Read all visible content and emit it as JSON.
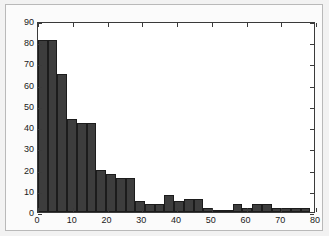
{
  "figure": {
    "background_color": "#fbfbfb",
    "plot_background_color": "#ffffff",
    "axis_color": "#3a3a3a",
    "bar_color": "#3d3d3d",
    "bar_edge_color": "#1c1c1c"
  },
  "chart_data": {
    "type": "bar",
    "title": "",
    "subtitle": "",
    "xlabel": "",
    "ylabel": "",
    "xlim": [
      0,
      80
    ],
    "ylim": [
      0,
      90
    ],
    "grid": false,
    "legend": null,
    "legend_position": "none",
    "bin_width": 2.8,
    "x_ticks": [
      0,
      10,
      20,
      30,
      40,
      50,
      60,
      70,
      80
    ],
    "x_tick_labels": [
      "0",
      "10",
      "20",
      "30",
      "40",
      "50",
      "60",
      "70",
      "80"
    ],
    "y_ticks": [
      0,
      10,
      20,
      30,
      40,
      50,
      60,
      70,
      80,
      90
    ],
    "y_tick_labels": [
      "0",
      "10",
      "20",
      "30",
      "40",
      "50",
      "60",
      "70",
      "80",
      "90"
    ],
    "bin_starts": [
      0.0,
      2.8,
      5.6,
      8.4,
      11.2,
      14.0,
      16.8,
      19.6,
      22.4,
      25.2,
      28.0,
      30.8,
      33.6,
      36.4,
      39.2,
      42.0,
      44.8,
      47.6,
      50.4,
      53.2,
      56.0,
      58.8,
      61.6,
      64.4,
      67.2,
      70.0,
      72.8,
      75.6
    ],
    "bin_centers": [
      1.4,
      4.2,
      7.0,
      9.8,
      12.6,
      15.4,
      18.2,
      21.0,
      23.8,
      26.6,
      29.4,
      32.2,
      35.0,
      37.8,
      40.6,
      43.4,
      46.2,
      49.0,
      51.8,
      54.6,
      57.4,
      60.2,
      63.0,
      65.8,
      68.6,
      71.4,
      74.2,
      77.0
    ],
    "categories": [
      "0-2.8",
      "2.8-5.6",
      "5.6-8.4",
      "8.4-11.2",
      "11.2-14",
      "14-16.8",
      "16.8-19.6",
      "19.6-22.4",
      "22.4-25.2",
      "25.2-28",
      "28-30.8",
      "30.8-33.6",
      "33.6-36.4",
      "36.4-39.2",
      "39.2-42",
      "42-44.8",
      "44.8-47.6",
      "47.6-50.4",
      "50.4-53.2",
      "53.2-56",
      "56-58.8",
      "58.8-61.6",
      "61.6-64.4",
      "64.4-67.2",
      "67.2-70",
      "70-72.8",
      "72.8-75.6",
      "75.6-78.4"
    ],
    "values": [
      81,
      81,
      65,
      44,
      42,
      42,
      20,
      18,
      16,
      16,
      5,
      4,
      4,
      8,
      5,
      6,
      6,
      2,
      1,
      1,
      4,
      2,
      4,
      4,
      2,
      2,
      2,
      2
    ]
  }
}
